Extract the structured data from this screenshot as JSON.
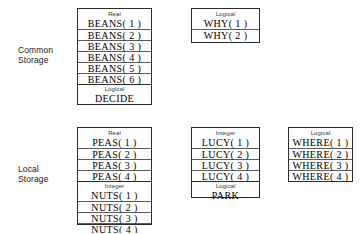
{
  "diagram": {
    "colors": {
      "border": "#2b2b2b",
      "row_rule": "#5a5a5a",
      "background": "#ffffff",
      "text": "#000000",
      "caption_text": "#333333"
    },
    "sections": [
      {
        "id": "common-storage",
        "label": "Common\nStorage",
        "boxes": [
          {
            "id": "common-beans",
            "groups": [
              {
                "type": "Real",
                "slots": [
                  "BEANS( 1 )",
                  "BEANS( 2 )",
                  "BEANS( 3 )",
                  "BEANS( 4 )",
                  "BEANS( 5 )",
                  "BEANS( 6 )"
                ]
              },
              {
                "type": "Logical",
                "slots": [
                  "DECIDE"
                ]
              }
            ]
          },
          {
            "id": "common-why",
            "groups": [
              {
                "type": "Logical",
                "slots": [
                  "WHY( 1 )",
                  "WHY( 2 )"
                ]
              }
            ]
          }
        ]
      },
      {
        "id": "local-storage",
        "label": "Local\nStorage",
        "boxes": [
          {
            "id": "local-peas-nuts",
            "groups": [
              {
                "type": "Real",
                "slots": [
                  "PEAS( 1 )",
                  "PEAS( 2 )",
                  "PEAS( 3 )",
                  "PEAS( 4 )"
                ]
              },
              {
                "type": "Integer",
                "slots": [
                  "NUTS( 1 )",
                  "NUTS( 2 )",
                  "NUTS( 3 )",
                  "NUTS( 4 )"
                ]
              }
            ]
          },
          {
            "id": "local-lucy",
            "groups": [
              {
                "type": "Integer",
                "slots": [
                  "LUCY( 1 )",
                  "LUCY( 2 )",
                  "LUCY( 3 )",
                  "LUCY( 4 )"
                ]
              },
              {
                "type": "Logical",
                "slots": [
                  "PARK"
                ]
              }
            ]
          },
          {
            "id": "local-where",
            "groups": [
              {
                "type": "Logical",
                "slots": [
                  "WHERE( 1 )",
                  "WHERE( 2 )",
                  "WHERE( 3 )",
                  "WHERE( 4 )"
                ]
              }
            ]
          }
        ]
      }
    ]
  },
  "layout": {
    "labels": [
      {
        "x": 18,
        "y": 45
      },
      {
        "x": 18,
        "y": 164
      }
    ],
    "boxes": [
      {
        "x": 77,
        "y": 8,
        "w": 75,
        "h": 97
      },
      {
        "x": 191,
        "y": 8,
        "w": 69,
        "h": 35
      },
      {
        "x": 77,
        "y": 127,
        "w": 75,
        "h": 98
      },
      {
        "x": 191,
        "y": 127,
        "w": 69,
        "h": 71
      },
      {
        "x": 288,
        "y": 127,
        "w": 65,
        "h": 55
      }
    ]
  }
}
